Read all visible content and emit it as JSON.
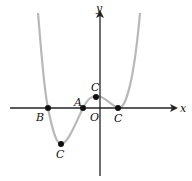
{
  "diagram": {
    "type": "function-graph",
    "axes": {
      "x_label": "x",
      "y_label": "y",
      "origin_label": "O"
    },
    "points": [
      {
        "id": "B",
        "label": "B",
        "role": "x-intercept (left)"
      },
      {
        "id": "A",
        "label": "A",
        "role": "x-intercept (middle)"
      },
      {
        "id": "C_min",
        "label": "C",
        "role": "local minimum"
      },
      {
        "id": "C_max",
        "label": "C",
        "role": "local maximum"
      },
      {
        "id": "C_right",
        "label": "C",
        "role": "tangent point on x-axis"
      }
    ],
    "colors": {
      "curve": "#b8b8b8",
      "axes": "#222222",
      "points": "#111111"
    }
  }
}
